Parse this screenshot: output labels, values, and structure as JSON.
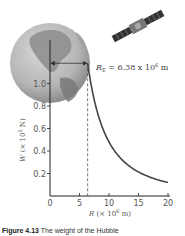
{
  "chart_data": {
    "type": "line",
    "title": "",
    "xlabel": "R (× 10⁶ m)",
    "xlabel_parts": {
      "var": "R",
      "pre": " (× 10",
      "exp": "6",
      "post": " m)"
    },
    "ylabel": "W (× 10⁵ N)",
    "ylabel_parts": {
      "var": "W",
      "pre": " (× 10",
      "exp": "5",
      "post": " N)"
    },
    "xlim": [
      0,
      20
    ],
    "ylim": [
      0,
      1.2
    ],
    "x_ticks": [
      0,
      5,
      10,
      15,
      20
    ],
    "x_tick_labels": [
      "0",
      "5",
      "10",
      "15",
      "20"
    ],
    "y_ticks": [
      0.2,
      0.4,
      0.6,
      0.8,
      1.0
    ],
    "y_tick_labels": [
      "0.2",
      "0.4",
      "0.6",
      "0.8",
      "1.0"
    ],
    "grid": false,
    "series": [
      {
        "name": "Weight vs distance",
        "formula": "W = W_E * (R_E / R)^2",
        "W_at_RE": 1.18,
        "x": [
          6.38,
          7,
          8,
          9,
          10,
          11,
          12,
          13,
          14,
          15,
          16,
          17,
          18,
          19,
          20
        ],
        "y": [
          1.18,
          0.98,
          0.75,
          0.59,
          0.48,
          0.4,
          0.33,
          0.28,
          0.24,
          0.21,
          0.19,
          0.17,
          0.15,
          0.13,
          0.12
        ],
        "color": "#444444"
      }
    ],
    "annotations": [
      {
        "type": "vline-dashed",
        "x": 6.38,
        "label": "Earth radius"
      },
      {
        "type": "arrow",
        "from_x": 0,
        "to_x": 6.38,
        "label_var": "R",
        "label_sub": "E",
        "label_rest": " = 6.38 x 10",
        "label_exp": "6",
        "label_post": " m"
      }
    ]
  },
  "illustrations": [
    "earth-globe",
    "satellite"
  ],
  "caption": {
    "bold": "Figure 4.13",
    "text": "  The weight of the Hubble"
  }
}
